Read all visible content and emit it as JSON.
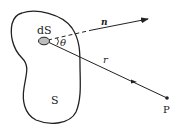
{
  "diagram": {
    "labels": {
      "surface_element": "dS",
      "angle": "θ",
      "normal": "n",
      "distance": "r",
      "surface": "S",
      "point": "P"
    },
    "colors": {
      "stroke": "#222222",
      "ellipse_fill": "#bdbdbd",
      "background": "#ffffff"
    }
  }
}
